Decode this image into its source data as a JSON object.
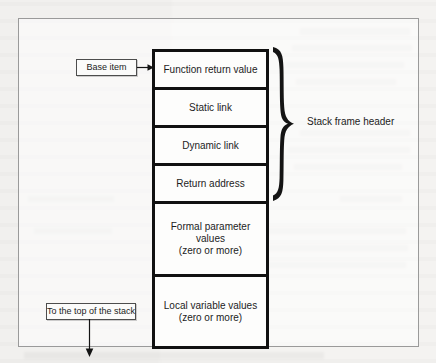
{
  "figure": {
    "stack_cells": [
      {
        "name": "function-return-value",
        "lines": [
          "Function return value"
        ]
      },
      {
        "name": "static-link",
        "lines": [
          "Static link"
        ]
      },
      {
        "name": "dynamic-link",
        "lines": [
          "Dynamic link"
        ]
      },
      {
        "name": "return-address",
        "lines": [
          "Return address"
        ]
      },
      {
        "name": "formal-parameter-values",
        "lines": [
          "Formal parameter",
          "values",
          "(zero or more)"
        ]
      },
      {
        "name": "local-variable-values",
        "lines": [
          "Local variable values",
          "(zero or more)"
        ]
      }
    ],
    "cells": {
      "function_return_value": "Function return value",
      "static_link": "Static link",
      "dynamic_link": "Dynamic link",
      "return_address": "Return address",
      "formal_parameter_l1": "Formal parameter",
      "formal_parameter_l2": "values",
      "formal_parameter_l3": "(zero or more)",
      "local_variable_l1": "Local variable values",
      "local_variable_l2": "(zero or more)"
    },
    "brace_label": "Stack frame header",
    "base_item_label": "Base item",
    "top_of_stack_label": "To the top of the stack",
    "colors": {
      "ink": "#111111",
      "paper": "#f4f3f1",
      "frame_border": "#9a9a9a",
      "tag_border": "#4d4d4d"
    }
  }
}
